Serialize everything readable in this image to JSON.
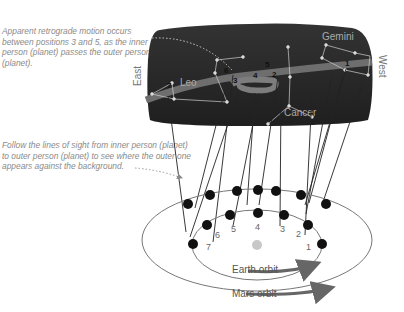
{
  "annotations": {
    "retrograde_note": "Apparent retrograde motion occurs between positions 3 and 5, as the inner person (planet) passes the outer person (planet).",
    "lines_of_sight_note": "Follow the lines of sight from inner person (planet) to outer person (planet) to see where the outer one appears against the background."
  },
  "sky": {
    "east_label": "East",
    "west_label": "West",
    "constellations": [
      "Leo",
      "Gemini",
      "Cancer"
    ],
    "apparent_positions": [
      "1",
      "2",
      "3",
      "4",
      "5",
      "6",
      "7"
    ]
  },
  "orbits": {
    "inner_label": "Earth orbit",
    "outer_label": "Mars orbit",
    "earth_positions": [
      "1",
      "2",
      "3",
      "4",
      "5",
      "6",
      "7"
    ]
  },
  "colors": {
    "sky": "#2b2b2b",
    "ecliptic_band": "#6e6e6e",
    "dots": "#111111",
    "sun": "#c8c8c8",
    "text": "#8a8a8a"
  }
}
